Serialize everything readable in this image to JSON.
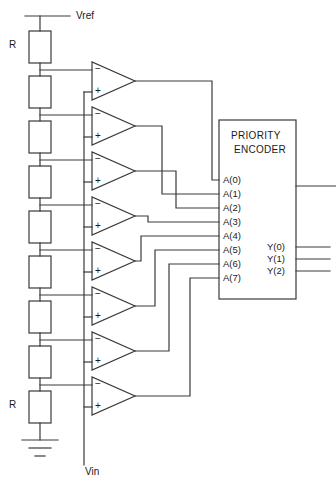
{
  "diagram": {
    "supply_label": "Vref",
    "input_label": "Vin",
    "resistor_label_top": "R",
    "resistor_label_bottom": "R",
    "ground_symbol": "ground-icon",
    "comparator_minus": "−",
    "comparator_plus": "+",
    "comparator_count": 8,
    "resistor_count": 9,
    "colors": {
      "wire": "#3a3a3a",
      "background": "#ffffff",
      "text": "#1a1a1a"
    }
  },
  "encoder": {
    "name_line1": "PRIORITY",
    "name_line2": "ENCODER",
    "inputs": [
      {
        "label": "A(0)",
        "y": 180
      },
      {
        "label": "A(1)",
        "y": 194
      },
      {
        "label": "A(2)",
        "y": 208
      },
      {
        "label": "A(3)",
        "y": 222
      },
      {
        "label": "A(4)",
        "y": 236
      },
      {
        "label": "A(5)",
        "y": 250
      },
      {
        "label": "A(6)",
        "y": 264
      },
      {
        "label": "A(7)",
        "y": 278
      }
    ],
    "outputs": [
      {
        "label": "Y(0)",
        "y": 247
      },
      {
        "label": "Y(1)",
        "y": 259
      },
      {
        "label": "Y(2)",
        "y": 271
      }
    ],
    "unlabeled_output_y": 186,
    "box": {
      "x": 219,
      "y": 120,
      "width": 77,
      "height": 179
    }
  },
  "comparators": [
    {
      "index": 0,
      "top": 62
    },
    {
      "index": 1,
      "top": 107
    },
    {
      "index": 2,
      "top": 152
    },
    {
      "index": 3,
      "top": 197
    },
    {
      "index": 4,
      "top": 242
    },
    {
      "index": 5,
      "top": 287
    },
    {
      "index": 6,
      "top": 332
    },
    {
      "index": 7,
      "top": 377
    }
  ]
}
